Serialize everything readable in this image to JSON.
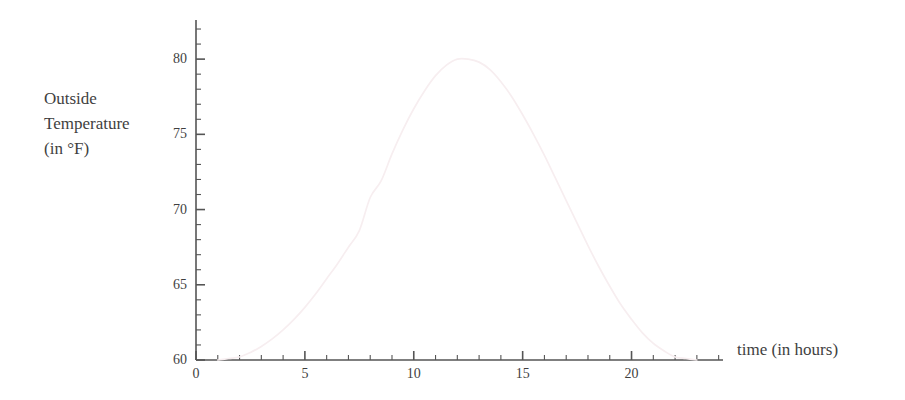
{
  "chart_data": {
    "type": "line",
    "title": "",
    "xlabel": "time (in hours)",
    "ylabel_lines": [
      "Outside",
      "Temperature",
      "(in °F)"
    ],
    "ylabel": "Outside Temperature (in °F)",
    "xlim": [
      0,
      24.2
    ],
    "ylim": [
      60,
      82.6
    ],
    "grid": false,
    "legend": null,
    "x_ticks_major": [
      0,
      5,
      10,
      15,
      20
    ],
    "x_tick_labels": [
      "0",
      "5",
      "10",
      "15",
      "20"
    ],
    "x_tick_minor_step": 1,
    "y_ticks_major": [
      60,
      65,
      70,
      75,
      80
    ],
    "y_tick_labels": [
      "60",
      "65",
      "70",
      "75",
      "80"
    ],
    "y_tick_minor_step": 1,
    "series": [
      {
        "name": "Outside Temperature",
        "color": "#f7eef0",
        "x": [
          1.0,
          1.5,
          2.0,
          2.5,
          3.0,
          3.5,
          4.0,
          4.5,
          5.0,
          5.5,
          6.0,
          6.5,
          7.0,
          7.5,
          8.0,
          8.5,
          9.0,
          9.5,
          10.0,
          10.5,
          11.0,
          11.5,
          12.0,
          12.5,
          13.0,
          13.5,
          14.0,
          14.5,
          15.0,
          15.5,
          16.0,
          16.5,
          17.0,
          17.5,
          18.0,
          18.5,
          19.0,
          19.5,
          20.0,
          20.5,
          21.0,
          21.5,
          22.0,
          22.5,
          23.0
        ],
        "y": [
          60.0,
          60.1,
          60.2,
          60.5,
          60.9,
          61.4,
          62.0,
          62.7,
          63.5,
          64.4,
          65.4,
          66.4,
          67.5,
          68.6,
          70.8,
          71.9,
          73.7,
          75.3,
          76.7,
          77.9,
          78.9,
          79.6,
          80.0,
          80.0,
          79.8,
          79.3,
          78.5,
          77.5,
          76.3,
          75.0,
          73.6,
          72.1,
          70.6,
          69.1,
          67.6,
          66.2,
          64.9,
          63.7,
          62.7,
          61.8,
          61.1,
          60.6,
          60.2,
          60.1,
          60.0
        ]
      }
    ],
    "peak": {
      "x": 12,
      "y": 80
    },
    "min": {
      "x": 0,
      "y": 60
    }
  },
  "axes": {
    "line_color": "#555555"
  }
}
